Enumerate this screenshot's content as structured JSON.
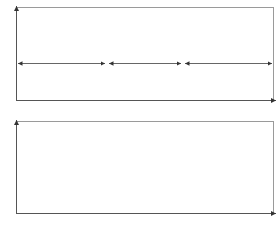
{
  "chart_data": [
    {
      "type": "line",
      "title": "",
      "ylabel": "γ̇",
      "xlabel": "t",
      "grid": false,
      "description": "Step shear rate profile: low-high-low",
      "x": [
        0,
        0.35,
        0.35,
        0.65,
        0.65,
        1.0
      ],
      "values": [
        0.25,
        0.25,
        0.85,
        0.85,
        0.25,
        0.25
      ],
      "regions": [
        {
          "label": "I",
          "x_range": [
            0,
            0.35
          ]
        },
        {
          "label": "II",
          "x_range": [
            0.35,
            0.65
          ]
        },
        {
          "label": "III",
          "x_range": [
            0.65,
            1.0
          ]
        }
      ],
      "ylim": [
        0,
        1
      ],
      "xlim": [
        0,
        1
      ]
    },
    {
      "type": "scatter",
      "title": "",
      "ylabel": "η",
      "xlabel": "t",
      "grid": false,
      "description": "Viscosity response (thixotropic recovery)",
      "x": [
        0,
        0.03,
        0.06,
        0.09,
        0.12,
        0.15,
        0.18,
        0.21,
        0.24,
        0.27,
        0.3,
        0.32,
        0.33,
        0.34,
        0.35,
        0.36,
        0.38,
        0.4,
        0.42,
        0.45,
        0.48,
        0.51,
        0.54,
        0.57,
        0.6,
        0.62,
        0.63,
        0.64,
        0.65,
        0.67,
        0.69,
        0.72,
        0.75,
        0.78,
        0.81,
        0.84,
        0.87,
        0.9,
        0.93,
        0.96,
        0.99
      ],
      "values": [
        0.76,
        0.74,
        0.72,
        0.71,
        0.69,
        0.68,
        0.66,
        0.65,
        0.64,
        0.64,
        0.64,
        0.62,
        0.55,
        0.48,
        0.42,
        0.35,
        0.29,
        0.25,
        0.21,
        0.17,
        0.14,
        0.11,
        0.09,
        0.08,
        0.08,
        0.08,
        0.14,
        0.21,
        0.3,
        0.38,
        0.46,
        0.53,
        0.59,
        0.64,
        0.66,
        0.66,
        0.66,
        0.67,
        0.67,
        0.67,
        0.68
      ],
      "ylim": [
        0,
        1
      ],
      "xlim": [
        0,
        1
      ]
    }
  ],
  "labels": {
    "top_y": "γ̇",
    "bottom_y": "η",
    "x": "t",
    "region_1": "I",
    "region_2": "II",
    "region_3": "III"
  }
}
